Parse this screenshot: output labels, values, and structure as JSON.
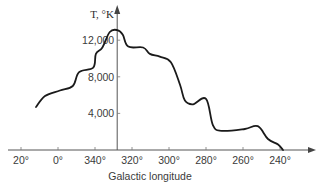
{
  "chart_data": {
    "type": "line",
    "title": "",
    "xlabel": "Galactic longitude",
    "ylabel": "T, °K",
    "x_note": "x values are galactic longitude expressed continuously: 20 = 20°, 0 = 0°, -20 = 340°, -40 = 320°, ... -120 = 240°",
    "xlim": [
      -126,
      26
    ],
    "ylim": [
      0,
      14000
    ],
    "x_ticks": [
      {
        "value": 20,
        "label": "20°"
      },
      {
        "value": 0,
        "label": "0°"
      },
      {
        "value": -20,
        "label": "340°"
      },
      {
        "value": -40,
        "label": "320°"
      },
      {
        "value": -60,
        "label": "300°"
      },
      {
        "value": -80,
        "label": "280°"
      },
      {
        "value": -100,
        "label": "260°"
      },
      {
        "value": -120,
        "label": "240°"
      }
    ],
    "y_ticks": [
      {
        "value": 4000,
        "label": "4,000"
      },
      {
        "value": 8000,
        "label": "8,000"
      },
      {
        "value": 12000,
        "label": "12,000"
      }
    ],
    "y_axis_at_x": -32,
    "grid": false,
    "series": [
      {
        "name": "Temperature",
        "x": [
          11.9,
          7,
          -1,
          -8,
          -11.4,
          -19,
          -20.5,
          -24,
          -28,
          -32,
          -35,
          -38,
          -46,
          -49.7,
          -55,
          -61,
          -66,
          -68.6,
          -73,
          -80,
          -83.8,
          -88.6,
          -101,
          -108,
          -113.5,
          -119,
          -121.6
        ],
        "values": [
          4700,
          5900,
          6500,
          7000,
          8500,
          9000,
          10500,
          11200,
          12900,
          13100,
          12600,
          11300,
          11200,
          10500,
          10200,
          9600,
          7100,
          5400,
          5000,
          5600,
          2700,
          2100,
          2300,
          2600,
          1200,
          600,
          0
        ]
      }
    ]
  }
}
